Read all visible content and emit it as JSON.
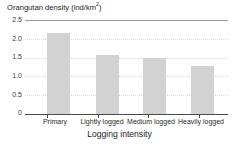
{
  "chart_data": {
    "type": "bar",
    "title": "",
    "ylabel": "Orangutan density (ind/km2)",
    "ylabel_base": "Orangutan density (ind/km",
    "ylabel_sup": "2",
    "ylabel_tail": ")",
    "xlabel": "Logging intensity",
    "categories": [
      "Primary",
      "Lightly logged",
      "Medium logged",
      "Heavily logged"
    ],
    "values": [
      2.15,
      1.57,
      1.48,
      1.28
    ],
    "ylim": [
      0,
      2.5
    ],
    "ytick_values": [
      2.5,
      2.0,
      1.5,
      1.0,
      0.5,
      0
    ],
    "ytick_labels": [
      "2.5",
      "2.0",
      "1.5",
      "1.0",
      "0.5",
      "0"
    ],
    "grid": true,
    "grid_axis": "y",
    "legend": "none",
    "series": [
      {
        "name": "Orangutan density",
        "values": [
          2.15,
          1.57,
          1.48,
          1.28
        ]
      }
    ]
  },
  "colors": {
    "bar_fill": "#d2d2d2",
    "gridline": "#d9d9d9",
    "top_rule": "#9a9a9a",
    "axis": "#4a4a4a",
    "text": "#1c1c1c",
    "background": "#ffffff"
  }
}
